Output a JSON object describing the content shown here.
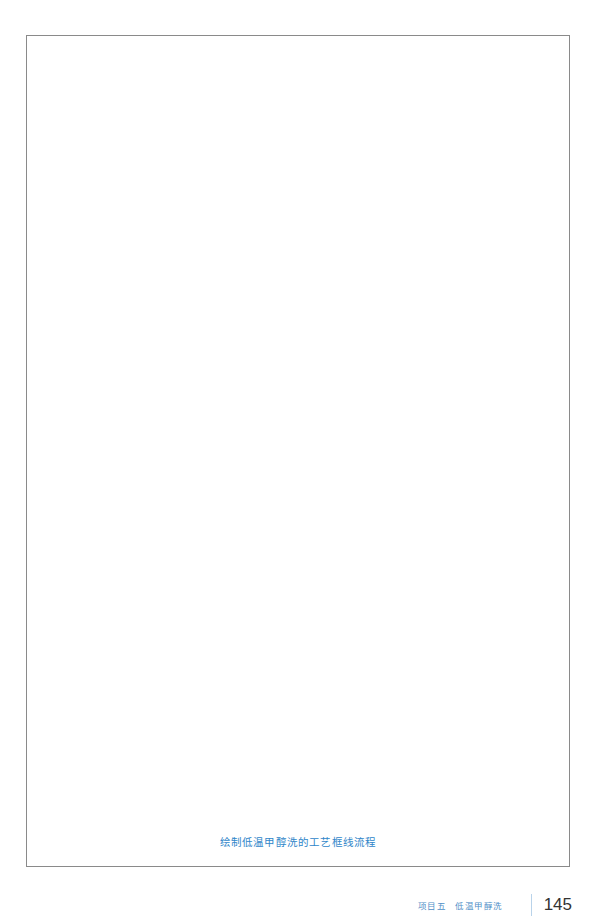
{
  "figure": {
    "caption": "绘制低温甲醇洗的工艺框线流程"
  },
  "footer": {
    "project": "项目五",
    "section_title": "低温甲醇洗",
    "page_number": "145"
  },
  "colors": {
    "caption_color": "#2f86c9",
    "footer_text_color": "#4f8fc7",
    "frame_border": "#8a8a8a",
    "page_number_color": "#333333"
  }
}
